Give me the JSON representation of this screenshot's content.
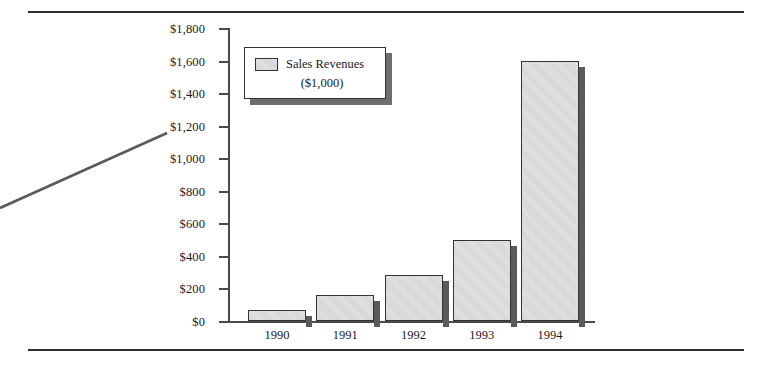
{
  "figure": {
    "rules": {
      "top_visible": true,
      "bottom_visible": true
    },
    "leader_line": {
      "present": true,
      "color": "#5a5a5a"
    }
  },
  "legend": {
    "label": "Sales Revenues",
    "sublabel": "($1,000)",
    "swatch_color": "#e3e3e3",
    "swatch_border": "#333333"
  },
  "colors": {
    "bar_fill": "#e3e3e3",
    "bar_outline": "#333333",
    "bar_shadow": "#5a5a5a",
    "axis": "#4a4a4a",
    "rule": "#2e2e2e",
    "text": "#1a1a1a"
  },
  "axis": {
    "y_ticks": [
      "$0",
      "$200",
      "$400",
      "$600",
      "$800",
      "$1,000",
      "$1,200",
      "$1,400",
      "$1,600",
      "$1,800"
    ],
    "x_ticks": [
      "1990",
      "1991",
      "1992",
      "1993",
      "1994"
    ]
  },
  "chart_data": {
    "type": "bar",
    "title": "",
    "subtitle": "",
    "xlabel": "",
    "ylabel": "",
    "categories": [
      "1990",
      "1991",
      "1992",
      "1993",
      "1994"
    ],
    "values": [
      70,
      160,
      285,
      500,
      1600
    ],
    "series": [
      {
        "name": "Sales Revenues ($1,000)",
        "values": [
          70,
          160,
          285,
          500,
          1600
        ]
      }
    ],
    "ylim": [
      0,
      1800
    ],
    "ytick_step": 200,
    "ytick_values": [
      0,
      200,
      400,
      600,
      800,
      1000,
      1200,
      1400,
      1600,
      1800
    ],
    "ytick_labels": [
      "$0",
      "$200",
      "$400",
      "$600",
      "$800",
      "$1,000",
      "$1,200",
      "$1,400",
      "$1,600",
      "$1,800"
    ],
    "grid": false,
    "legend_position": "inside-top-left",
    "value_prefix": "$",
    "units": "thousands of dollars"
  }
}
